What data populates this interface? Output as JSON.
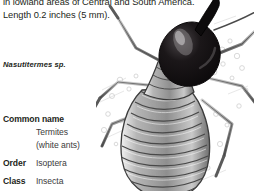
{
  "page": {
    "background_color": "#ffffff",
    "text_color": "#231f20"
  },
  "description": {
    "text": "in lowland areas of Central and South America.\nLength 0.2 inches (5 mm)."
  },
  "species": {
    "name": "Nasutitermes sp."
  },
  "classification": {
    "rows": [
      {
        "key": "Common name",
        "values": [
          "Termites",
          "(white ants)"
        ]
      },
      {
        "key": "Order",
        "values": [
          "Isoptera"
        ]
      },
      {
        "key": "Class",
        "values": [
          "Insecta"
        ]
      }
    ],
    "common_name_key": "Common name",
    "common_name_value_1": "Termites",
    "common_name_value_2": "(white ants)",
    "order_key": "Order",
    "order_value": "Isoptera",
    "class_key": "Class",
    "class_value": "Insecta"
  },
  "illustration": {
    "subject": "nasute-termite-soldier",
    "description": "pen-and-ink drawing of a termite seen from above",
    "head_color": "#100d0e",
    "body_color": "#8a8a8a",
    "outline_color": "#3a3a3a",
    "parts": [
      "nasus",
      "head",
      "antenna-left",
      "antenna-right",
      "thorax",
      "abdomen",
      "legs"
    ]
  }
}
